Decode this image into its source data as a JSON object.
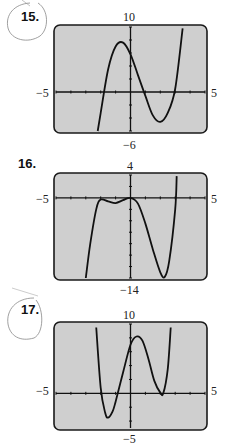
{
  "chart_data": [
    {
      "type": "line",
      "problem": "15.",
      "window": {
        "xmin": -5,
        "xmax": 5,
        "ymin": -6,
        "ymax": 10
      },
      "labels": {
        "top": "10",
        "bottom": "-6",
        "left": "-5",
        "right": "5"
      },
      "grid": false,
      "x": [
        -2.2,
        -2,
        -1.5,
        -1,
        -0.5,
        0,
        0.5,
        1,
        1.5,
        2,
        2.5,
        3,
        3.5
      ],
      "y": [
        -6,
        -3.2,
        3.5,
        7,
        7.6,
        5.8,
        2.6,
        -0.6,
        -3.6,
        -4.6,
        -3.2,
        0.5,
        9.8
      ]
    },
    {
      "type": "line",
      "problem": "16.",
      "window": {
        "xmin": -5,
        "xmax": 5,
        "ymin": -14,
        "ymax": 4
      },
      "labels": {
        "top": "4",
        "bottom": "-14",
        "left": "-5",
        "right": "5"
      },
      "grid": false,
      "x": [
        -3,
        -2.7,
        -2.3,
        -2,
        -1.5,
        -1,
        -0.5,
        0,
        0.5,
        1,
        1.5,
        2,
        2.3,
        2.6,
        3,
        3.1
      ],
      "y": [
        -14,
        -8,
        -2,
        -0.3,
        -0.6,
        -0.9,
        -0.4,
        0,
        -1,
        -4.5,
        -9,
        -13,
        -13.8,
        -11,
        -2,
        3.8
      ]
    },
    {
      "type": "line",
      "problem": "17.",
      "window": {
        "xmin": -5,
        "xmax": 5,
        "ymin": -5,
        "ymax": 10
      },
      "labels": {
        "top": "10",
        "bottom": "-5",
        "left": "-5",
        "right": "5"
      },
      "grid": false,
      "x": [
        -2.3,
        -2,
        -1.7,
        -1.5,
        -1.2,
        -1,
        -0.5,
        0,
        0.4,
        0.8,
        1.2,
        1.6,
        2,
        2.2,
        2.5,
        2.7
      ],
      "y": [
        9.5,
        0.8,
        -2.8,
        -3.5,
        -2.6,
        -1.2,
        3,
        7,
        8.2,
        7.6,
        5,
        1.8,
        0.1,
        0,
        3.5,
        9.5
      ]
    }
  ]
}
